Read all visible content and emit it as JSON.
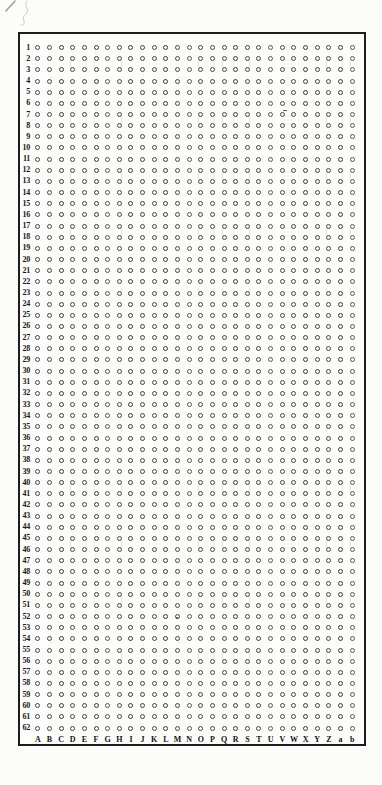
{
  "page": {
    "background_color": "#fcfcfa",
    "pencil_mark": {
      "description": "faint handwritten pencil scribble in top-left corner",
      "color": "#bdbdbd"
    }
  },
  "grid": {
    "rows": 62,
    "columns": 28,
    "row_labels": [
      "1",
      "2",
      "3",
      "4",
      "5",
      "6",
      "7",
      "8",
      "9",
      "10",
      "11",
      "12",
      "13",
      "14",
      "15",
      "16",
      "17",
      "18",
      "19",
      "20",
      "21",
      "22",
      "23",
      "24",
      "25",
      "26",
      "27",
      "28",
      "29",
      "30",
      "31",
      "32",
      "33",
      "34",
      "35",
      "36",
      "37",
      "38",
      "39",
      "40",
      "41",
      "42",
      "43",
      "44",
      "45",
      "46",
      "47",
      "48",
      "49",
      "50",
      "51",
      "52",
      "53",
      "54",
      "55",
      "56",
      "57",
      "58",
      "59",
      "60",
      "61",
      "62"
    ],
    "column_labels": [
      "A",
      "B",
      "C",
      "D",
      "E",
      "F",
      "G",
      "H",
      "I",
      "J",
      "K",
      "L",
      "M",
      "N",
      "O",
      "P",
      "Q",
      "R",
      "S",
      "T",
      "U",
      "V",
      "W",
      "X",
      "Y",
      "Z",
      "a",
      "b"
    ],
    "dot_symbol": "small open circle",
    "dot_color": "#474747",
    "border_color": "#1d1d1b",
    "artifacts": [
      {
        "row": "7",
        "near_column": "V",
        "type": "short-dash-left-of-dot"
      },
      {
        "row": "53",
        "near_column": "M",
        "type": "ink-speck-above-dot"
      }
    ]
  }
}
